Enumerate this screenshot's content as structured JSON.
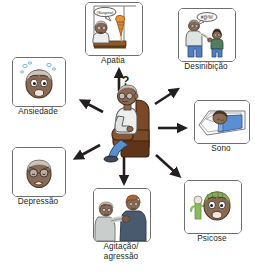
{
  "figure": {
    "type": "radial-diagram",
    "language": "pt-BR",
    "center": {
      "name": "elderly-person-in-armchair",
      "question_mark": "?",
      "description": "Idoso sentado em poltrona"
    },
    "colors": {
      "frame_stroke": "#6d6e70",
      "text": "#231f20",
      "arrow": "#231f20",
      "background": "#ffffff",
      "skin_dark": "#8a6a52",
      "skin_shadow": "#6f523e",
      "chair_brown": "#7a4a28",
      "chair_brown_dark": "#5e3519",
      "shirt_grey": "#e6e7e8",
      "pants_blue": "#5a8fd0",
      "blanket_blue": "#5b8fd4",
      "hallucination_green": "#7ab648",
      "sweat_blue": "#a8d4f0"
    },
    "panels": [
      {
        "id": "apatia",
        "label": "Apatia",
        "icon": "apathy-icon",
        "speech_text": "(Suspiro)",
        "description": "Idoso apatico com sorvete derretendo"
      },
      {
        "id": "desinibicao",
        "label": "Desinibição",
        "icon": "disinhibition-icon",
        "speech_text": "#@%!",
        "description": "Homem falando palavrao para crianca"
      },
      {
        "id": "ansiedade",
        "label": "Ansiedade",
        "icon": "anxiety-icon",
        "description": "Rosto preocupado com gotas de suor"
      },
      {
        "id": "sono",
        "label": "Sono",
        "icon": "sleep-icon",
        "description": "Pessoa dormindo na cama"
      },
      {
        "id": "depressao",
        "label": "Depressão",
        "icon": "depression-icon",
        "description": "Rosto triste e cabisbaixo"
      },
      {
        "id": "psicose",
        "label": "Psicose",
        "icon": "psychosis-icon",
        "description": "Rosto com alucinacao verde"
      },
      {
        "id": "agitacao",
        "label": "Agitação/\nagressão",
        "icon": "agitation-aggression-icon",
        "description": "Idoso agarrando outra pessoa"
      }
    ],
    "arrows": [
      {
        "id": "arrow-to-apatia",
        "direction": "up",
        "from": "center",
        "to": "apatia"
      },
      {
        "id": "arrow-to-desinibicao",
        "direction": "up-right",
        "from": "center",
        "to": "desinibicao"
      },
      {
        "id": "arrow-to-ansiedade",
        "direction": "up-left",
        "from": "center",
        "to": "ansiedade"
      },
      {
        "id": "arrow-to-sono",
        "direction": "right",
        "from": "center",
        "to": "sono"
      },
      {
        "id": "arrow-to-depressao",
        "direction": "down-left",
        "from": "center",
        "to": "depressao"
      },
      {
        "id": "arrow-to-psicose",
        "direction": "down-right",
        "from": "center",
        "to": "psicose"
      },
      {
        "id": "arrow-to-agitacao",
        "direction": "down",
        "from": "center",
        "to": "agitacao"
      }
    ]
  }
}
